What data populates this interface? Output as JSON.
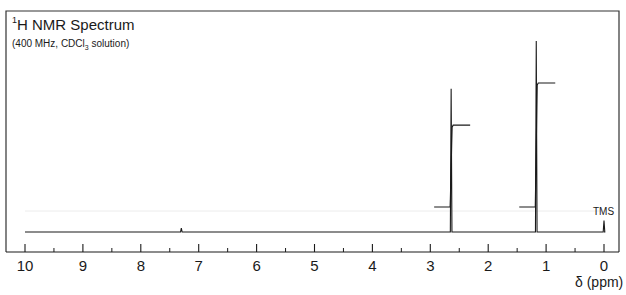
{
  "title": {
    "nucleus_superscript": "1",
    "nucleus": "H",
    "text": " NMR Spectrum"
  },
  "subtitle": {
    "prefix": "(400 MHz, CDCl",
    "subscript": "3",
    "suffix": " solution)"
  },
  "xlabel": "δ (ppm)",
  "tms_label": "TMS",
  "colors": {
    "line": "#1a1a1a",
    "frame": "#333333",
    "faint": "#e6e6e6"
  },
  "chart_data": {
    "type": "line",
    "title": "1H NMR Spectrum",
    "subtitle": "(400 MHz, CDCl3 solution)",
    "xlabel": "δ (ppm)",
    "ylabel": "",
    "xlim": [
      10,
      0
    ],
    "x_reversed": true,
    "x_ticks_major": [
      10,
      9,
      8,
      7,
      6,
      5,
      4,
      3,
      2,
      1,
      0
    ],
    "x_ticks_minor": [
      9.5,
      8.5,
      7.5,
      6.5,
      5.5,
      4.5,
      3.5,
      2.5,
      1.5,
      0.5
    ],
    "grid": false,
    "legend": null,
    "peaks": [
      {
        "shift_ppm": 2.64,
        "relative_height": 0.75,
        "multiplicity": "singlet",
        "integration_relative": 2
      },
      {
        "shift_ppm": 1.17,
        "relative_height": 1.0,
        "multiplicity": "singlet",
        "integration_relative": 3
      },
      {
        "shift_ppm": 7.3,
        "relative_height": 0.02,
        "multiplicity": "singlet",
        "note": "small solvent residual"
      },
      {
        "shift_ppm": 0.0,
        "relative_height": 0.06,
        "label": "TMS"
      }
    ],
    "integration_curves": [
      {
        "peak_ppm": 2.64,
        "step_height_relative": 0.66
      },
      {
        "peak_ppm": 1.17,
        "step_height_relative": 1.0
      }
    ],
    "annotations": [
      "TMS"
    ]
  },
  "tick_labels": [
    "10",
    "9",
    "8",
    "7",
    "6",
    "5",
    "4",
    "3",
    "2",
    "1",
    "0"
  ]
}
